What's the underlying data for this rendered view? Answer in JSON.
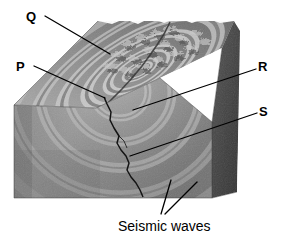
{
  "figure": {
    "background_color": "#ffffff"
  },
  "labels": [
    {
      "id": "Q",
      "text": "Q",
      "role": "surface-feature-callout"
    },
    {
      "id": "P",
      "text": "P",
      "role": "epicenter-callout"
    },
    {
      "id": "R",
      "text": "R",
      "role": "ground-surface-callout"
    },
    {
      "id": "S",
      "text": "S",
      "role": "fault-callout"
    }
  ],
  "caption": {
    "text": "Seismic waves",
    "role": "wavefront-caption"
  },
  "colors": {
    "top_surface_light": "#b9b9b9",
    "top_surface_dark": "#6e6e6e",
    "front_face_light": "#9a9a9a",
    "front_face_dark": "#6a6a6a",
    "side_face": "#4a4a4a",
    "side_face_dark": "#3a3a3a",
    "fault_line": "#1a1a1a",
    "leader_line": "#000000",
    "text": "#000000"
  },
  "leader_lines": [
    {
      "name": "leader-Q",
      "from": [
        45,
        16
      ],
      "to": [
        108,
        53
      ]
    },
    {
      "name": "leader-P",
      "from": [
        35,
        66
      ],
      "to": [
        104,
        97
      ]
    },
    {
      "name": "leader-R",
      "from": [
        255,
        70
      ],
      "to": [
        133,
        110
      ]
    },
    {
      "name": "leader-S",
      "from": [
        256,
        114
      ],
      "to": [
        130,
        155
      ]
    },
    {
      "name": "leader-seismic-left",
      "from": [
        160,
        214
      ],
      "to": [
        172,
        180
      ]
    },
    {
      "name": "leader-seismic-right",
      "from": [
        164,
        214
      ],
      "to": [
        196,
        183
      ]
    }
  ],
  "geometry": {
    "top_face": [
      [
        14,
        105
      ],
      [
        98,
        21
      ],
      [
        234,
        21
      ],
      [
        222,
        48
      ],
      [
        160,
        78
      ],
      [
        96,
        108
      ]
    ],
    "front_face": [
      [
        14,
        105
      ],
      [
        14,
        198
      ],
      [
        212,
        198
      ],
      [
        212,
        122
      ]
    ],
    "side_face": [
      [
        212,
        122
      ],
      [
        234,
        21
      ],
      [
        240,
        30
      ],
      [
        236,
        195
      ],
      [
        212,
        198
      ]
    ]
  },
  "wave_rings": {
    "count": 5,
    "description": "concentric seismic wavefronts radiating from focus"
  }
}
